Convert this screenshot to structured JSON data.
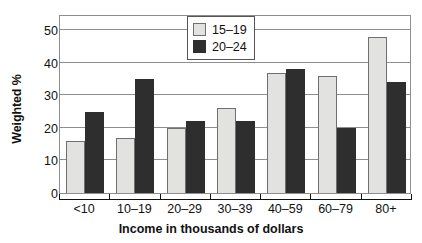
{
  "chart_data": {
    "type": "bar",
    "title": "",
    "xlabel": "Income in thousands of dollars",
    "ylabel": "Weighted %",
    "categories": [
      "<10",
      "10–19",
      "20–29",
      "30–39",
      "40–59",
      "60–79",
      "80+"
    ],
    "series": [
      {
        "name": "15–19",
        "color": "#e2e2e0",
        "values": [
          16,
          17,
          20,
          26,
          37,
          36,
          48
        ]
      },
      {
        "name": "20–24",
        "color": "#2e2e2e",
        "values": [
          25,
          35,
          22,
          22,
          38,
          20,
          34
        ]
      }
    ],
    "ylim": [
      0,
      55
    ],
    "yticks": [
      0,
      10,
      20,
      30,
      40,
      50
    ],
    "ytick_labels": [
      "0",
      "10",
      "20",
      "30",
      "40",
      "50"
    ],
    "grid": true,
    "legend_position": "top-center"
  }
}
